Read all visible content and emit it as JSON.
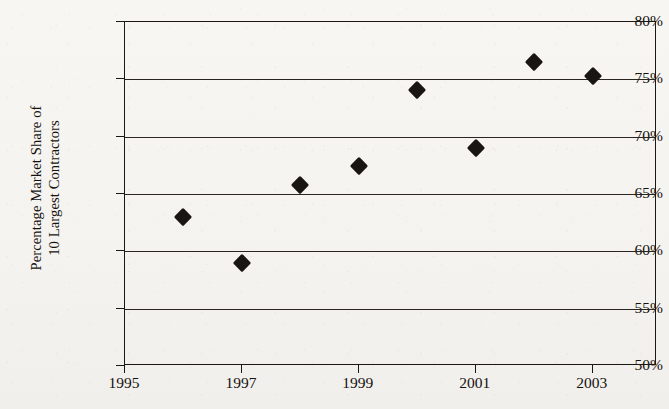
{
  "chart_data": {
    "type": "scatter",
    "title": "",
    "xlabel": "",
    "ylabel": "Percentage Market Share of 10 Largest Contractors",
    "ylabel_lines": [
      "Percentage Market Share of",
      "10 Largest Contractors"
    ],
    "x": [
      1996,
      1997,
      1998,
      1999,
      2000,
      2001,
      2002,
      2003
    ],
    "values": [
      63.0,
      59.0,
      65.8,
      67.4,
      74.1,
      69.0,
      76.5,
      75.3
    ],
    "series": [
      {
        "name": "Percentage Market Share of 10 Largest Contractors",
        "marker": "diamond",
        "color": "#191513",
        "points": [
          {
            "x": 1996,
            "y": 63.0
          },
          {
            "x": 1997,
            "y": 59.0
          },
          {
            "x": 1998,
            "y": 65.8
          },
          {
            "x": 1999,
            "y": 67.4
          },
          {
            "x": 2000,
            "y": 74.1
          },
          {
            "x": 2001,
            "y": 69.0
          },
          {
            "x": 2002,
            "y": 76.5
          },
          {
            "x": 2003,
            "y": 75.3
          }
        ]
      }
    ],
    "ylim": [
      50,
      80
    ],
    "xlim": [
      1995,
      2004.1
    ],
    "ytick_values": [
      80,
      75,
      70,
      65,
      60,
      55,
      50
    ],
    "ytick_labels": [
      "80%",
      "75%",
      "70%",
      "65%",
      "60%",
      "55%",
      "50%"
    ],
    "xtick_values": [
      1995,
      1997,
      1999,
      2001,
      2003
    ],
    "xtick_labels": [
      "1995",
      "1997",
      "1999",
      "2001",
      "2003"
    ],
    "grid": "horizontal",
    "legend": "none",
    "legend_position": "none",
    "annotations": []
  },
  "style": {
    "ink_color": "#191513",
    "grid_color": "#2b2520",
    "frame_color": "#1b1713",
    "background_color": "#f6f5f2"
  }
}
